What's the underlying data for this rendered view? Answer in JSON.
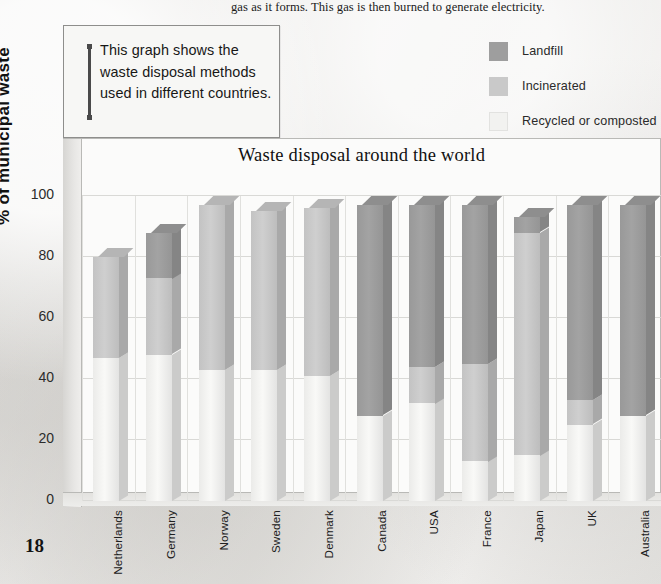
{
  "body_text": "gas as it forms. This gas is then burned to generate electricity.",
  "callout": {
    "text": "This graph shows the waste disposal methods used in different countries."
  },
  "page_number": "18",
  "source_note": "Source: UN Statistics Division",
  "legend": {
    "items": [
      {
        "label": "Landfill",
        "color": "#9e9e9e"
      },
      {
        "label": "Incinerated",
        "color": "#c9c9c9"
      },
      {
        "label": "Recycled or composted",
        "color": "#f2f2f0"
      }
    ]
  },
  "chart_data": {
    "type": "bar",
    "subtype": "stacked-3d-column",
    "title": "Waste disposal around the world",
    "xlabel": "",
    "ylabel": "% of municipal waste",
    "ylim": [
      0,
      100
    ],
    "yticks": [
      0,
      20,
      40,
      60,
      80,
      100
    ],
    "ytick_labels": [
      "0",
      "20",
      "40",
      "60",
      "80",
      "100"
    ],
    "grid": true,
    "legend_position": "top-right",
    "categories": [
      "Netherlands",
      "Germany",
      "Norway",
      "Sweden",
      "Denmark",
      "Canada",
      "USA",
      "France",
      "Japan",
      "UK",
      "Australia"
    ],
    "series": [
      {
        "name": "Recycled or composted",
        "color": "#f2f2f0",
        "values": [
          47,
          48,
          43,
          43,
          41,
          28,
          32,
          13,
          15,
          25,
          28
        ]
      },
      {
        "name": "Incinerated",
        "color": "#c9c9c9",
        "values": [
          33,
          25,
          54,
          52,
          55,
          0,
          12,
          32,
          73,
          8,
          0
        ]
      },
      {
        "name": "Landfill",
        "color": "#9e9e9e",
        "values": [
          0,
          15,
          0,
          0,
          0,
          69,
          53,
          52,
          5,
          64,
          69
        ]
      }
    ],
    "totals": [
      80,
      88,
      97,
      95,
      96,
      97,
      97,
      97,
      93,
      97,
      97
    ]
  }
}
